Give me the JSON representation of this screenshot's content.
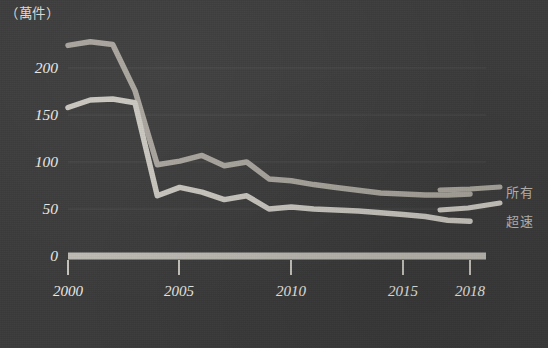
{
  "unit_label": "（萬件）",
  "colors": {
    "background": "#3a3a3a",
    "line_all": "#a8a49c",
    "line_speed": "#c9c6bf",
    "axis": "#bdbab3",
    "grid": "#474747",
    "text": "#eceae4"
  },
  "legend": [
    {
      "name": "legend-all",
      "label": "所有",
      "color": "#a8a49c"
    },
    {
      "name": "legend-speeding",
      "label": "超速",
      "color": "#c9c6bf"
    }
  ],
  "chart_data": {
    "type": "line",
    "title": "",
    "subtitle": "",
    "xlabel": "",
    "ylabel": "（萬件）",
    "ylim": [
      0,
      230
    ],
    "xlim": [
      2000,
      2018
    ],
    "grid": true,
    "legend_position": "right",
    "yticks": [
      "200",
      "150",
      "100",
      "50",
      "0"
    ],
    "ytick_values": [
      200,
      150,
      100,
      50,
      0
    ],
    "xticks": [
      "2000",
      "2005",
      "2010",
      "2015",
      "2018"
    ],
    "xtick_values": [
      2000,
      2005,
      2010,
      2015,
      2018
    ],
    "x": [
      2000,
      2001,
      2002,
      2003,
      2004,
      2005,
      2006,
      2007,
      2008,
      2009,
      2010,
      2011,
      2012,
      2013,
      2014,
      2015,
      2016,
      2017,
      2018
    ],
    "series": [
      {
        "name": "所有",
        "color": "#a8a49c",
        "values": [
          224,
          228,
          225,
          176,
          97,
          101,
          107,
          96,
          100,
          82,
          80,
          76,
          73,
          70,
          67,
          66,
          65,
          65,
          66
        ]
      },
      {
        "name": "超速",
        "color": "#c9c6bf",
        "values": [
          158,
          166,
          167,
          163,
          64,
          73,
          68,
          60,
          64,
          50,
          52,
          50,
          49,
          48,
          46,
          44,
          42,
          38,
          37
        ]
      }
    ]
  }
}
